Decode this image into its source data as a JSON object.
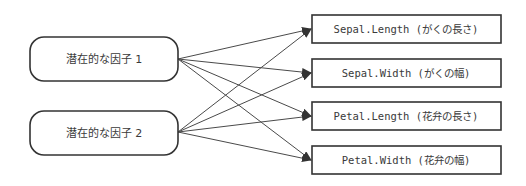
{
  "diagram": {
    "type": "factor-analysis path diagram",
    "colors": {
      "stroke": "#333333",
      "edge": "#4a4a4a",
      "text": "#3a3a3a",
      "background": "#ffffff"
    },
    "factors": [
      {
        "id": "f1",
        "label": "潜在的な因子 1"
      },
      {
        "id": "f2",
        "label": "潜在的な因子 2"
      }
    ],
    "variables": [
      {
        "id": "v1",
        "label": "Sepal.Length (がくの長さ)"
      },
      {
        "id": "v2",
        "label": "Sepal.Width (がくの幅)"
      },
      {
        "id": "v3",
        "label": "Petal.Length (花弁の長さ)"
      },
      {
        "id": "v4",
        "label": "Petal.Width (花弁の幅)"
      }
    ],
    "edges": [
      {
        "from": "f1",
        "to": "v1"
      },
      {
        "from": "f1",
        "to": "v2"
      },
      {
        "from": "f1",
        "to": "v3"
      },
      {
        "from": "f1",
        "to": "v4"
      },
      {
        "from": "f2",
        "to": "v1"
      },
      {
        "from": "f2",
        "to": "v2"
      },
      {
        "from": "f2",
        "to": "v3"
      },
      {
        "from": "f2",
        "to": "v4"
      }
    ]
  }
}
